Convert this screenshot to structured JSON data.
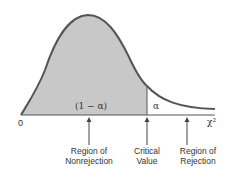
{
  "diagram": {
    "type": "chi-square distribution",
    "axis": {
      "origin_label": "0",
      "x_label": "χ²"
    },
    "regions": {
      "nonrejection_area_label": "(1 − α)",
      "rejection_area_label": "α"
    },
    "annotations": [
      {
        "id": "nonrejection",
        "line1": "Region of",
        "line2": "Nonrejection"
      },
      {
        "id": "critical",
        "line1": "Critical",
        "line2": "Value"
      },
      {
        "id": "rejection",
        "line1": "Region of",
        "line2": "Rejection"
      }
    ],
    "colors": {
      "shade": "#c8c8c8",
      "curve": "#555555",
      "axis": "#555555",
      "text": "#333333"
    }
  }
}
